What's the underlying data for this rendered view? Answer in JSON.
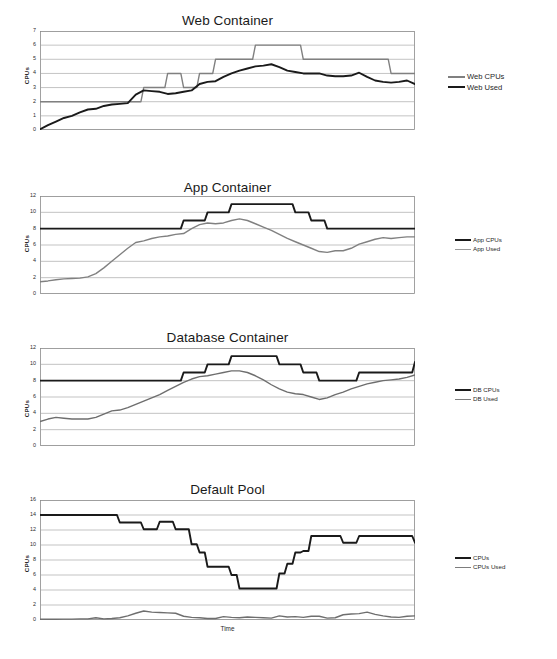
{
  "document": {
    "kind": "multi-panel-line-chart-figure",
    "background_color": "#ffffff",
    "panel_count": 4
  },
  "colors": {
    "series_black": "#1a1a1a",
    "series_gray": "#808080",
    "gridline": "#9a9a9a",
    "axis": "#808080",
    "text": "#231f20"
  },
  "charts": [
    {
      "id": "web-container",
      "type": "line",
      "title": "Web Container",
      "xlabel": "",
      "ylabel": "CPUs",
      "ylim": [
        0,
        7
      ],
      "yticks": [
        0,
        1,
        2,
        3,
        4,
        5,
        6,
        7
      ],
      "ytick_labels": [
        "0",
        "1",
        "2",
        "3",
        "4",
        "5",
        "6",
        "7"
      ],
      "grid": true,
      "legend_position": "right",
      "legend": [
        "Web CPUs",
        "Web Used"
      ],
      "series": [
        {
          "name": "Web CPUs",
          "color": "#808080",
          "style": "step",
          "values": [
            2,
            2,
            2,
            2,
            2,
            2,
            2,
            2,
            2,
            2,
            2,
            2,
            2,
            3,
            3,
            3,
            4,
            4,
            3,
            3,
            4,
            4,
            5,
            5,
            5,
            5,
            5,
            6,
            6,
            6,
            6,
            6,
            6,
            5,
            5,
            5,
            5,
            5,
            5,
            5,
            5,
            5,
            5,
            5,
            4,
            4,
            4,
            4
          ]
        },
        {
          "name": "Web Used",
          "color": "#1a1a1a",
          "style": "line",
          "values": [
            0.05,
            0.35,
            0.6,
            0.85,
            1.0,
            1.25,
            1.45,
            1.5,
            1.7,
            1.8,
            1.85,
            1.9,
            2.5,
            2.8,
            2.75,
            2.7,
            2.55,
            2.6,
            2.7,
            2.8,
            3.25,
            3.4,
            3.45,
            3.75,
            4.0,
            4.2,
            4.35,
            4.5,
            4.55,
            4.65,
            4.45,
            4.2,
            4.1,
            4.0,
            4.0,
            4.0,
            3.85,
            3.8,
            3.8,
            3.85,
            4.05,
            3.75,
            3.5,
            3.4,
            3.35,
            3.4,
            3.5,
            3.25
          ]
        }
      ]
    },
    {
      "id": "app-container",
      "type": "line",
      "title": "App Container",
      "xlabel": "",
      "ylabel": "CPUs",
      "ylim": [
        0,
        12
      ],
      "yticks": [
        0,
        2,
        4,
        6,
        8,
        10,
        12
      ],
      "ytick_labels": [
        "0",
        "2",
        "4",
        "6",
        "8",
        "10",
        "12"
      ],
      "grid": true,
      "legend_position": "right",
      "legend": [
        "App CPUs",
        "App Used"
      ],
      "series": [
        {
          "name": "App CPUs",
          "color": "#1a1a1a",
          "style": "step",
          "values": [
            8,
            8,
            8,
            8,
            8,
            8,
            8,
            8,
            8,
            8,
            8,
            8,
            8,
            8,
            8,
            8,
            8,
            8,
            9,
            9,
            9,
            10,
            10,
            10,
            11,
            11,
            11,
            11,
            11,
            11,
            11,
            11,
            10,
            10,
            9,
            9,
            8,
            8,
            8,
            8,
            8,
            8,
            8,
            8,
            8,
            8,
            8,
            8
          ]
        },
        {
          "name": "App Used",
          "color": "#808080",
          "style": "line",
          "values": [
            1.5,
            1.6,
            1.75,
            1.85,
            1.9,
            1.95,
            2.1,
            2.5,
            3.2,
            4.0,
            4.8,
            5.6,
            6.3,
            6.5,
            6.8,
            7.0,
            7.1,
            7.3,
            7.4,
            8.0,
            8.5,
            8.7,
            8.6,
            8.7,
            9.0,
            9.2,
            9.0,
            8.6,
            8.2,
            7.8,
            7.3,
            6.8,
            6.4,
            6.0,
            5.6,
            5.2,
            5.1,
            5.3,
            5.3,
            5.6,
            6.1,
            6.4,
            6.7,
            6.9,
            6.8,
            6.9,
            7.0,
            7.0
          ]
        }
      ]
    },
    {
      "id": "database-container",
      "type": "line",
      "title": "Database Container",
      "xlabel": "",
      "ylabel": "CPUs",
      "ylim": [
        0,
        12
      ],
      "yticks": [
        0,
        2,
        4,
        6,
        8,
        10,
        12
      ],
      "ytick_labels": [
        "0",
        "2",
        "4",
        "6",
        "8",
        "10",
        "12"
      ],
      "grid": true,
      "legend_position": "right",
      "legend": [
        "DB CPUs",
        "DB Used"
      ],
      "series": [
        {
          "name": "DB CPUs",
          "color": "#1a1a1a",
          "style": "step",
          "values": [
            8,
            8,
            8,
            8,
            8,
            8,
            8,
            8,
            8,
            8,
            8,
            8,
            8,
            8,
            8,
            8,
            8,
            8,
            9,
            9,
            9,
            10,
            10,
            10,
            11,
            11,
            11,
            11,
            11,
            11,
            10,
            10,
            10,
            9,
            9,
            8,
            8,
            8,
            8,
            8,
            9,
            9,
            9,
            9,
            9,
            9,
            9,
            10.3
          ]
        },
        {
          "name": "DB Used",
          "color": "#6e6e6e",
          "style": "line",
          "values": [
            3.0,
            3.3,
            3.5,
            3.4,
            3.3,
            3.3,
            3.3,
            3.5,
            3.9,
            4.3,
            4.4,
            4.7,
            5.1,
            5.5,
            5.9,
            6.3,
            6.8,
            7.3,
            7.8,
            8.2,
            8.5,
            8.6,
            8.8,
            9.0,
            9.2,
            9.2,
            9.0,
            8.6,
            8.1,
            7.5,
            7.0,
            6.6,
            6.4,
            6.3,
            6.0,
            5.7,
            5.9,
            6.3,
            6.6,
            7.0,
            7.3,
            7.6,
            7.8,
            8.0,
            8.1,
            8.2,
            8.4,
            8.7
          ]
        }
      ]
    },
    {
      "id": "default-pool",
      "type": "line",
      "title": "Default Pool",
      "xlabel": "Time",
      "ylabel": "CPUs",
      "ylim": [
        0,
        16
      ],
      "yticks": [
        0,
        2,
        4,
        6,
        8,
        10,
        12,
        14,
        16
      ],
      "ytick_labels": [
        "0",
        "2",
        "4",
        "6",
        "8",
        "10",
        "12",
        "14",
        "16"
      ],
      "grid": true,
      "legend_position": "right",
      "legend": [
        "CPUs",
        "CPUs Used"
      ],
      "series": [
        {
          "name": "CPUs",
          "color": "#1a1a1a",
          "style": "step",
          "values": [
            14,
            14,
            14,
            14,
            14,
            14,
            14,
            14,
            14,
            14,
            13,
            13,
            13,
            12.1,
            12.1,
            13.1,
            13.1,
            12.1,
            12.1,
            10.1,
            9.0,
            7.1,
            7.1,
            7.1,
            6.0,
            4.2,
            4.2,
            4.2,
            4.2,
            4.2,
            6.2,
            7.5,
            9.0,
            9.2,
            11.2,
            11.2,
            11.2,
            11.2,
            10.3,
            10.3,
            11.2,
            11.2,
            11.2,
            11.2,
            11.2,
            11.2,
            11.2,
            10.3
          ]
        },
        {
          "name": "CPUs Used",
          "color": "#6e6e6e",
          "style": "line",
          "values": [
            0.1,
            0.1,
            0.1,
            0.12,
            0.12,
            0.15,
            0.15,
            0.3,
            0.15,
            0.2,
            0.3,
            0.55,
            0.9,
            1.2,
            1.05,
            1.0,
            0.95,
            0.9,
            0.5,
            0.35,
            0.3,
            0.2,
            0.2,
            0.45,
            0.35,
            0.3,
            0.4,
            0.35,
            0.3,
            0.25,
            0.55,
            0.4,
            0.45,
            0.35,
            0.5,
            0.5,
            0.25,
            0.3,
            0.7,
            0.8,
            0.85,
            1.05,
            0.75,
            0.55,
            0.4,
            0.35,
            0.5,
            0.55
          ]
        }
      ]
    }
  ]
}
